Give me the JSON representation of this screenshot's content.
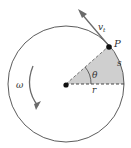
{
  "diagram": {
    "labels": {
      "velocity": "v",
      "velocity_subscript": "t",
      "point": "P",
      "arc_length": "s",
      "angle": "θ",
      "radius": "r",
      "angular_velocity": "ω"
    },
    "colors": {
      "circle": "#4a4a4a",
      "sector_fill": "#c8c8c8",
      "arrow": "#6a6a6a",
      "dot": "#111111"
    }
  }
}
